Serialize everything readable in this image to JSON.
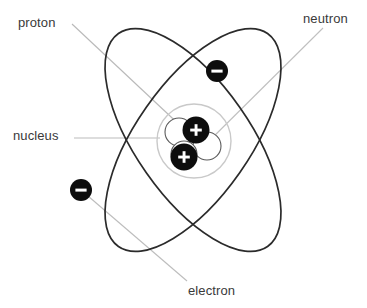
{
  "diagram": {
    "type": "atomic-model",
    "background_color": "#ffffff",
    "labels": {
      "proton": "proton",
      "neutron": "neutron",
      "nucleus": "nucleus",
      "electron": "electron"
    },
    "particles": {
      "proton_symbol": "+",
      "electron_symbol": "−",
      "proton_count": 2,
      "neutron_count": 2,
      "electron_count": 2
    },
    "colors": {
      "orbit_stroke": "#2b2b2b",
      "leader_line": "#b5b5b5",
      "nucleus_ring": "#c8c8c8",
      "proton_fill": "#0d0d0d",
      "neutron_fill": "#ffffff",
      "neutron_stroke": "#555555",
      "electron_fill": "#0d0d0d",
      "label_text": "#3a3a3a"
    },
    "geometry": {
      "center_x": 193,
      "center_y": 140,
      "orbit_rx": 130,
      "orbit_ry": 57,
      "orbit_a_rotation": -55,
      "orbit_b_rotation": 55,
      "nucleus_ring_radius": 37,
      "proton_radius": 13,
      "neutron_radius": 13,
      "electron_radius": 11
    }
  }
}
